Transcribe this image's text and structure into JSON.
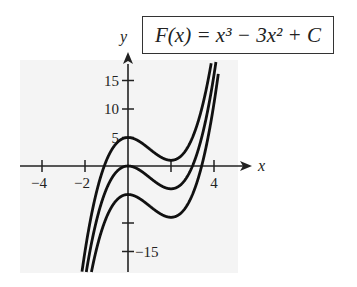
{
  "formula": "F(x) = x³ − 3x² + C",
  "chart_data": {
    "type": "line",
    "xlabel": "x",
    "ylabel": "y",
    "xlim": [
      -5,
      5.5
    ],
    "ylim": [
      -18,
      19
    ],
    "x_ticks": [
      -4,
      -2,
      2,
      4
    ],
    "x_tick_labels": [
      "-4",
      "-2",
      "",
      "4"
    ],
    "y_ticks": [
      15,
      10,
      5,
      -10,
      -15
    ],
    "y_tick_labels": [
      "15",
      "10",
      "5",
      "",
      "-15"
    ],
    "grid": false,
    "legend": null,
    "series": [
      {
        "name": "C = 5",
        "C": 5,
        "local_max": [
          0,
          5
        ],
        "local_min": [
          2,
          1
        ]
      },
      {
        "name": "C = 0",
        "C": 0,
        "local_max": [
          0,
          0
        ],
        "local_min": [
          2,
          -4
        ]
      },
      {
        "name": "C = -5",
        "C": -5,
        "local_max": [
          0,
          -5
        ],
        "local_min": [
          2,
          -9
        ]
      }
    ]
  },
  "colors": {
    "curve": "#111111",
    "axis": "#222222",
    "plot_bg": "#f4f4f4"
  }
}
